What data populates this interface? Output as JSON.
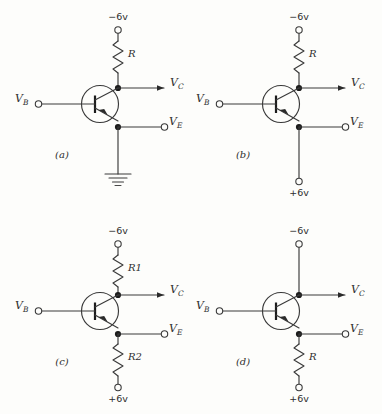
{
  "figure": {
    "background_color": "#fdfdfb",
    "ink_color": "#2e2e2e",
    "transistor_type": "pnp"
  },
  "panels": [
    {
      "id": "a",
      "caption": "(a)",
      "top_supply": "−6v",
      "top_element": "resistor",
      "top_resistor_label": "R",
      "base_label": "V",
      "base_sub": "B",
      "collector_label": "V",
      "collector_sub": "C",
      "emitter_label": "V",
      "emitter_sub": "E",
      "bottom_element": "ground",
      "bottom_resistor_label": "",
      "bottom_supply": ""
    },
    {
      "id": "b",
      "caption": "(b)",
      "top_supply": "−6v",
      "top_element": "resistor",
      "top_resistor_label": "R",
      "base_label": "V",
      "base_sub": "B",
      "collector_label": "V",
      "collector_sub": "C",
      "emitter_label": "V",
      "emitter_sub": "E",
      "bottom_element": "wire",
      "bottom_resistor_label": "",
      "bottom_supply": "+6v"
    },
    {
      "id": "c",
      "caption": "(c)",
      "top_supply": "−6v",
      "top_element": "resistor",
      "top_resistor_label": "R1",
      "base_label": "V",
      "base_sub": "B",
      "collector_label": "V",
      "collector_sub": "C",
      "emitter_label": "V",
      "emitter_sub": "E",
      "bottom_element": "resistor",
      "bottom_resistor_label": "R2",
      "bottom_supply": "+6v"
    },
    {
      "id": "d",
      "caption": "(d)",
      "top_supply": "−6v",
      "top_element": "wire",
      "top_resistor_label": "",
      "base_label": "V",
      "base_sub": "B",
      "collector_label": "V",
      "collector_sub": "C",
      "emitter_label": "V",
      "emitter_sub": "E",
      "bottom_element": "resistor",
      "bottom_resistor_label": "R",
      "bottom_supply": "+6v"
    }
  ]
}
